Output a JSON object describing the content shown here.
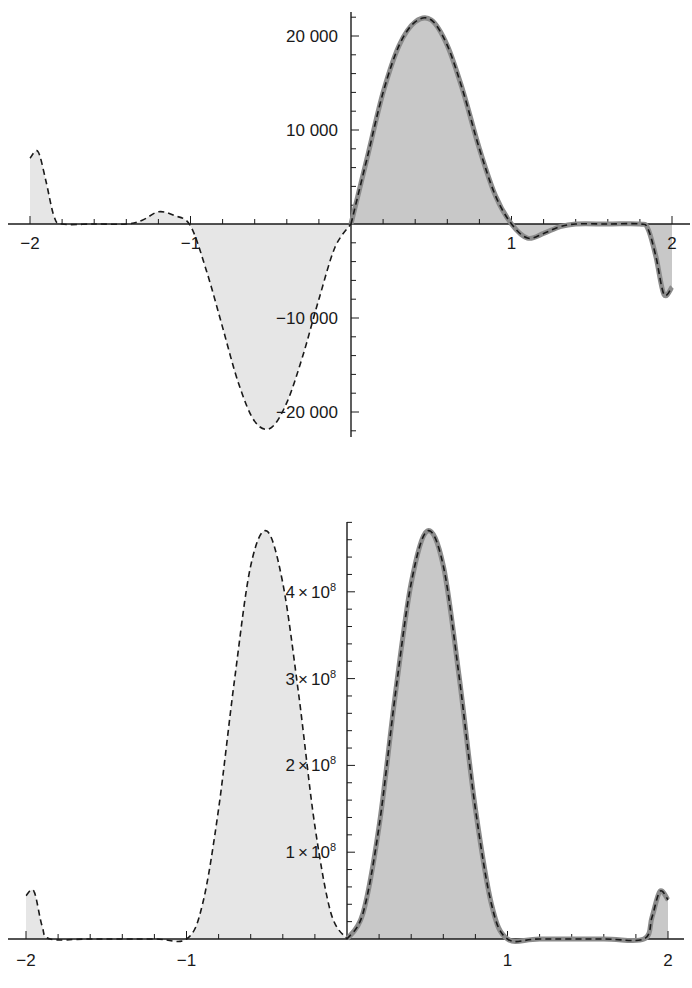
{
  "chart_data": [
    {
      "type": "area",
      "title": "",
      "xlabel": "",
      "ylabel": "",
      "xlim": [
        -2,
        2
      ],
      "ylim": [
        -22000,
        22000
      ],
      "grid": false,
      "legend": "none",
      "x_ticks": [
        -2,
        -1,
        1,
        2
      ],
      "x_tick_labels": [
        "−2",
        "−1",
        "1",
        "2"
      ],
      "y_ticks": [
        20000,
        10000,
        -10000,
        -20000
      ],
      "y_tick_labels": [
        "20 000",
        "10 000",
        "−10 000",
        "−20 000"
      ],
      "series": [
        {
          "name": "dashed curve (light fill)",
          "style": "dashed black, light gray fill",
          "x": [
            -2.0,
            -1.95,
            -1.9,
            -1.85,
            -1.8,
            -1.6,
            -1.4,
            -1.3,
            -1.2,
            -1.1,
            -1.0,
            -0.9,
            -0.8,
            -0.7,
            -0.6,
            -0.5,
            -0.4,
            -0.3,
            -0.2,
            -0.1,
            0.0
          ],
          "y": [
            7000,
            7700,
            4500,
            800,
            0,
            0,
            0,
            400,
            1300,
            900,
            -200,
            -5000,
            -11000,
            -17000,
            -21000,
            -21700,
            -19000,
            -14000,
            -8000,
            -2500,
            0
          ]
        },
        {
          "name": "solid gray curve with dashed overlay (dark fill)",
          "style": "thick gray line with dashed overlay, darker gray fill",
          "x": [
            0.0,
            0.1,
            0.2,
            0.3,
            0.4,
            0.5,
            0.6,
            0.7,
            0.8,
            0.9,
            1.0,
            1.1,
            1.2,
            1.3,
            1.4,
            1.6,
            1.8,
            1.85,
            1.9,
            1.95,
            2.0
          ],
          "y": [
            0,
            7000,
            14000,
            19000,
            21500,
            21700,
            19000,
            14000,
            8000,
            3000,
            0,
            -1500,
            -1000,
            -300,
            0,
            0,
            0,
            -500,
            -3500,
            -7500,
            -6700
          ]
        }
      ]
    },
    {
      "type": "area",
      "title": "",
      "xlabel": "",
      "ylabel": "",
      "xlim": [
        -2,
        2
      ],
      "ylim": [
        0,
        480000000
      ],
      "grid": false,
      "legend": "none",
      "x_ticks": [
        -2,
        -1,
        1,
        2
      ],
      "x_tick_labels": [
        "−2",
        "−1",
        "1",
        "2"
      ],
      "y_ticks": [
        100000000,
        200000000,
        300000000,
        400000000
      ],
      "y_tick_labels": [
        {
          "mantissa": "1",
          "times": "×",
          "base": "10",
          "exp": "8"
        },
        {
          "mantissa": "2",
          "times": "×",
          "base": "10",
          "exp": "8"
        },
        {
          "mantissa": "3",
          "times": "×",
          "base": "10",
          "exp": "8"
        },
        {
          "mantissa": "4",
          "times": "×",
          "base": "10",
          "exp": "8"
        }
      ],
      "series": [
        {
          "name": "dashed curve (light fill)",
          "style": "dashed black, light gray fill",
          "x": [
            -2.0,
            -1.95,
            -1.9,
            -1.85,
            -1.6,
            -1.2,
            -1.0,
            -0.9,
            -0.8,
            -0.7,
            -0.6,
            -0.5,
            -0.4,
            -0.3,
            -0.2,
            -0.1,
            0.0
          ],
          "y": [
            50000000,
            55000000,
            15000000,
            0,
            0,
            0,
            0,
            40000000,
            150000000,
            300000000,
            430000000,
            470000000,
            410000000,
            280000000,
            130000000,
            30000000,
            0
          ],
          "peak": {
            "x": -0.5,
            "y": 470000000
          }
        },
        {
          "name": "solid gray curve with dashed overlay (dark fill)",
          "style": "thick gray line with dashed overlay, darker gray fill",
          "x": [
            0.0,
            0.1,
            0.2,
            0.3,
            0.4,
            0.5,
            0.6,
            0.7,
            0.8,
            0.9,
            1.0,
            1.2,
            1.6,
            1.85,
            1.9,
            1.95,
            2.0
          ],
          "y": [
            0,
            30000000,
            130000000,
            280000000,
            410000000,
            470000000,
            430000000,
            300000000,
            150000000,
            40000000,
            0,
            0,
            0,
            0,
            25000000,
            55000000,
            45000000
          ],
          "peak": {
            "x": 0.5,
            "y": 470000000
          }
        }
      ]
    }
  ],
  "colors": {
    "light_fill": "#e6e6e6",
    "dark_fill": "#c8c8c8",
    "curve_gray": "#8c8c8c",
    "dash": "#1a1a1a",
    "axis": "#1a1a1a"
  }
}
